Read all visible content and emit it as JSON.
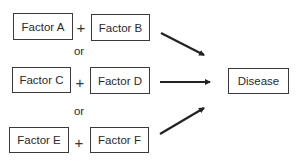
{
  "diagram": {
    "rows": [
      {
        "left": {
          "label": "Factor A"
        },
        "operator": "+",
        "right": {
          "label": "Factor B"
        }
      },
      {
        "left": {
          "label": "Factor C"
        },
        "operator": "+",
        "right": {
          "label": "Factor D"
        }
      },
      {
        "left": {
          "label": "Factor E"
        },
        "operator": "+",
        "right": {
          "label": "Factor F"
        }
      }
    ],
    "connectors": [
      "or",
      "or"
    ],
    "outcome": {
      "label": "Disease"
    },
    "colors": {
      "stroke": "#3a3a3a",
      "text": "#2a2a2a",
      "arrow": "#222222",
      "background": "#ffffff"
    }
  }
}
